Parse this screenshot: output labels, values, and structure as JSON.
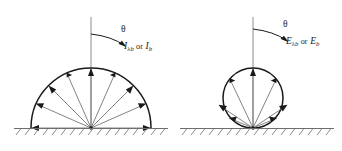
{
  "figure": {
    "background_color": "#ffffff",
    "line_color": "#1a1a1a",
    "ray_color": "#6e6e6e",
    "axis_color": "#8c8c8c"
  },
  "panels": [
    {
      "id": "left",
      "kind": "semicircle",
      "description": "isotropic blackbody intensity, equal-length rays on a semicircle",
      "theta_symbol": "θ",
      "quantity_primary": "I",
      "quantity_primary_subscript": "λb",
      "conjunction": "or",
      "quantity_secondary": "I",
      "quantity_secondary_subscript": "b",
      "center_x": 91,
      "baseline_y": 128,
      "radius": 60,
      "ray_angles_deg": [
        0,
        22.5,
        45,
        67.5,
        90,
        112.5,
        135,
        157.5,
        180
      ],
      "ray_relative_lengths": [
        1,
        1,
        1,
        1,
        1,
        1,
        1,
        1,
        1
      ]
    },
    {
      "id": "right",
      "kind": "circle",
      "description": "cosine-law blackbody emissive power, circle tangent to the surface",
      "theta_symbol": "θ",
      "quantity_primary": "E",
      "quantity_primary_subscript": "λb",
      "conjunction": "or",
      "quantity_secondary": "E",
      "quantity_secondary_subscript": "b",
      "center_x": 253,
      "baseline_y": 128,
      "radius": 30,
      "ray_angles_deg": [
        0,
        22.5,
        45,
        67.5,
        90,
        112.5,
        135,
        157.5,
        180
      ],
      "ray_relative_lengths": [
        0,
        0.3827,
        0.7071,
        0.9239,
        1,
        0.9239,
        0.7071,
        0.3827,
        0
      ]
    }
  ],
  "baseline": {
    "left_start_x": 14,
    "left_end_x": 168,
    "right_start_x": 180,
    "right_end_x": 334,
    "y": 128,
    "hatch_count": 17,
    "hatch_length": 7
  }
}
